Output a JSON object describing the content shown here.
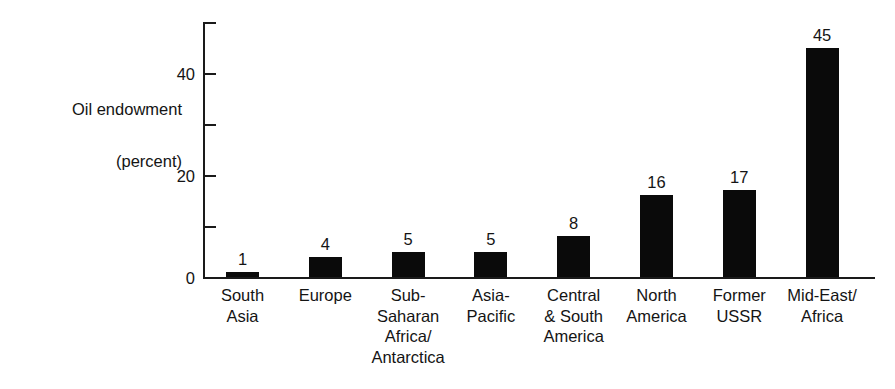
{
  "chart_data": {
    "type": "bar",
    "title": "",
    "xlabel": "",
    "ylabel": "Oil endowment\n(percent)",
    "ylabel_line1": "Oil endowment",
    "ylabel_line2": "(percent)",
    "categories": [
      "South\nAsia",
      "Europe",
      "Sub-\nSaharan\nAfrica/\nAntarctica",
      "Asia-\nPacific",
      "Central\n& South\nAmerica",
      "North\nAmerica",
      "Former\nUSSR",
      "Mid-East/\nAfrica"
    ],
    "values": [
      1,
      4,
      5,
      5,
      8,
      16,
      17,
      45
    ],
    "value_labels": [
      "1",
      "4",
      "5",
      "5",
      "8",
      "16",
      "17",
      "45"
    ],
    "ylim": [
      0,
      50
    ],
    "y_major_ticks": [
      0,
      20,
      40
    ],
    "y_major_tick_labels": [
      "0",
      "20",
      "40"
    ],
    "y_minor_ticks": [
      10,
      30,
      50
    ],
    "grid": false,
    "legend": null,
    "bar_color": "#0a0a0a",
    "axis_color": "#1a1a1a",
    "background_color": "#ffffff"
  }
}
